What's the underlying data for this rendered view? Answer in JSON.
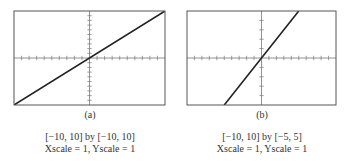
{
  "chart_data": [
    {
      "type": "line",
      "panel_label": "(a)",
      "title": "",
      "xlabel": "",
      "ylabel": "",
      "window_text": "[−10, 10] by [−10, 10]",
      "scale_text": "Xscale = 1, Yscale = 1",
      "xlim": [
        -10,
        10
      ],
      "ylim": [
        -10,
        10
      ],
      "xscale": 1,
      "yscale": 1,
      "grid": false,
      "series": [
        {
          "name": "y = x",
          "x": [
            -10,
            10
          ],
          "y": [
            -10,
            10
          ]
        }
      ]
    },
    {
      "type": "line",
      "panel_label": "(b)",
      "title": "",
      "xlabel": "",
      "ylabel": "",
      "window_text": "[−10, 10] by [−5, 5]",
      "scale_text": "Xscale = 1, Yscale = 1",
      "xlim": [
        -10,
        10
      ],
      "ylim": [
        -5,
        5
      ],
      "xscale": 1,
      "yscale": 1,
      "grid": false,
      "series": [
        {
          "name": "y = x",
          "x": [
            -5,
            5
          ],
          "y": [
            -5,
            5
          ]
        }
      ]
    }
  ],
  "panels": [
    {
      "label": "(a)",
      "window": "[−10, 10] by [−10, 10]",
      "scale": "Xscale = 1, Yscale = 1"
    },
    {
      "label": "(b)",
      "window": "[−10, 10] by [−5, 5]",
      "scale": "Xscale = 1, Yscale = 1"
    }
  ],
  "colors": {
    "frame": "#555555",
    "line": "#222222",
    "axis": "#777777"
  }
}
